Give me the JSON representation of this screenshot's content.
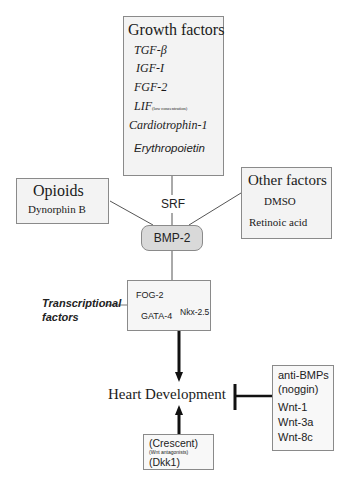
{
  "growth_factors": {
    "title": "Growth factors",
    "items": [
      "TGF-β",
      "IGF-I",
      "FGF-2",
      "LIF",
      "Cardiotrophin-1",
      "Erythropoietin"
    ],
    "lif_note": "(low concentration)"
  },
  "opioids": {
    "title": "Opioids",
    "items": [
      "Dynorphin B"
    ]
  },
  "other_factors": {
    "title": "Other factors",
    "items": [
      "DMSO",
      "Retinoic acid"
    ]
  },
  "srf_label": "SRF",
  "bmp2_label": "BMP-2",
  "transcriptional": {
    "label_line1": "Transcriptional",
    "label_line2": "factors",
    "items": [
      "FOG-2",
      "GATA-4",
      "Nkx-2.5"
    ]
  },
  "heart_development": "Heart Development",
  "inhibitors": {
    "items": [
      "anti-BMPs",
      "(noggin)",
      "Wnt-1",
      "Wnt-3a",
      "Wnt-8c"
    ]
  },
  "crescent": {
    "line1": "(Crescent)",
    "line2": "(Wnt antagonists)",
    "line3": "(Dkk1)"
  },
  "colors": {
    "box_border": "#8a8a8a",
    "box_fill": "#f3f3f3",
    "bmp_fill": "#d9d9d9",
    "arrow": "#111111"
  }
}
